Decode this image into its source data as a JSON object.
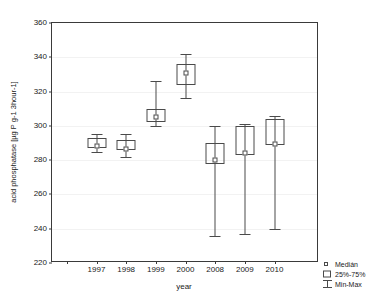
{
  "chart_data": {
    "type": "box",
    "title": "",
    "xlabel": "year",
    "ylabel": "acid phosphatase [µg P g-1 3hour-1]",
    "categories": [
      "1997",
      "1998",
      "1999",
      "2000",
      "2008",
      "2009",
      "2010"
    ],
    "ylim": [
      220,
      360
    ],
    "yticks": [
      220,
      240,
      260,
      280,
      300,
      320,
      340,
      360
    ],
    "grid": true,
    "legend_position": "bottom-right",
    "series": [
      {
        "name": "1997",
        "min": 285,
        "q1": 287,
        "median": 288,
        "q3": 293,
        "max": 295
      },
      {
        "name": "1998",
        "min": 282,
        "q1": 286,
        "median": 286.5,
        "q3": 292,
        "max": 295
      },
      {
        "name": "1999",
        "min": 300,
        "q1": 302,
        "median": 305,
        "q3": 310,
        "max": 326
      },
      {
        "name": "2000",
        "min": 316,
        "q1": 324,
        "median": 331,
        "q3": 336,
        "max": 342
      },
      {
        "name": "2008",
        "min": 236,
        "q1": 278,
        "median": 280,
        "q3": 290,
        "max": 300
      },
      {
        "name": "2009",
        "min": 237,
        "q1": 283,
        "median": 284,
        "q3": 300,
        "max": 301
      },
      {
        "name": "2010",
        "min": 240,
        "q1": 289,
        "median": 289.5,
        "q3": 304,
        "max": 306
      }
    ],
    "legend": [
      {
        "label": "Medián",
        "symbol": "small-square"
      },
      {
        "label": "25%-75%",
        "symbol": "box"
      },
      {
        "label": "Min-Max",
        "symbol": "whisker"
      }
    ]
  },
  "colors": {
    "frame": "#3a3a3a",
    "glyph": "#4a4a4a",
    "grid": "#f2f2f2",
    "text": "#1a1a1a",
    "background": "#ffffff"
  }
}
